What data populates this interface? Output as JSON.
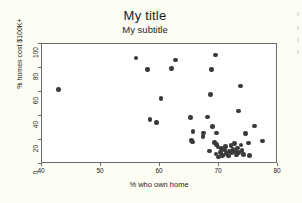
{
  "chart_data": {
    "type": "scatter",
    "title": "My title",
    "subtitle": "My subtitle",
    "xlabel": "% who own home",
    "ylabel": "% homes cost $100K+",
    "xlim": [
      40,
      80
    ],
    "ylim": [
      0,
      100
    ],
    "xticks": [
      40,
      50,
      60,
      70,
      80
    ],
    "yticks": [
      0,
      20,
      40,
      60,
      80,
      100
    ],
    "grid": false,
    "legend": null,
    "marker": {
      "shape": "circle",
      "color": "#3a3a3a",
      "size": 4.6
    },
    "points": [
      {
        "x": 42.8,
        "y": 62.0
      },
      {
        "x": 55.9,
        "y": 88.5
      },
      {
        "x": 57.9,
        "y": 78.6
      },
      {
        "x": 58.3,
        "y": 37.3
      },
      {
        "x": 59.4,
        "y": 34.8
      },
      {
        "x": 60.2,
        "y": 54.4
      },
      {
        "x": 61.9,
        "y": 79.4
      },
      {
        "x": 62.6,
        "y": 86.6
      },
      {
        "x": 65.2,
        "y": 38.8
      },
      {
        "x": 65.6,
        "y": 27.3
      },
      {
        "x": 65.3,
        "y": 19.8
      },
      {
        "x": 65.5,
        "y": 18.2
      },
      {
        "x": 67.3,
        "y": 23.1
      },
      {
        "x": 67.4,
        "y": 25.9
      },
      {
        "x": 68.1,
        "y": 39.3
      },
      {
        "x": 68.6,
        "y": 58.0
      },
      {
        "x": 68.7,
        "y": 78.8
      },
      {
        "x": 69.4,
        "y": 90.9
      },
      {
        "x": 68.9,
        "y": 31.1
      },
      {
        "x": 69.6,
        "y": 25.9
      },
      {
        "x": 68.4,
        "y": 11.0
      },
      {
        "x": 69.2,
        "y": 18.0
      },
      {
        "x": 69.6,
        "y": 16.4
      },
      {
        "x": 69.8,
        "y": 14.0
      },
      {
        "x": 69.5,
        "y": 8.3
      },
      {
        "x": 69.9,
        "y": 5.7
      },
      {
        "x": 70.3,
        "y": 9.4
      },
      {
        "x": 70.4,
        "y": 12.8
      },
      {
        "x": 70.6,
        "y": 7.1
      },
      {
        "x": 70.9,
        "y": 11.6
      },
      {
        "x": 71.1,
        "y": 14.6
      },
      {
        "x": 71.3,
        "y": 8.8
      },
      {
        "x": 71.6,
        "y": 6.5
      },
      {
        "x": 71.8,
        "y": 11.0
      },
      {
        "x": 72.0,
        "y": 15.2
      },
      {
        "x": 72.1,
        "y": 9.0
      },
      {
        "x": 72.4,
        "y": 12.2
      },
      {
        "x": 72.6,
        "y": 17.0
      },
      {
        "x": 72.8,
        "y": 10.2
      },
      {
        "x": 73.0,
        "y": 7.5
      },
      {
        "x": 73.1,
        "y": 13.4
      },
      {
        "x": 73.3,
        "y": 44.3
      },
      {
        "x": 73.4,
        "y": 9.8
      },
      {
        "x": 73.6,
        "y": 65.0
      },
      {
        "x": 73.7,
        "y": 16.0
      },
      {
        "x": 73.9,
        "y": 11.4
      },
      {
        "x": 74.2,
        "y": 7.9
      },
      {
        "x": 74.5,
        "y": 25.4
      },
      {
        "x": 75.0,
        "y": 17.6
      },
      {
        "x": 75.2,
        "y": 7.2
      },
      {
        "x": 76.0,
        "y": 31.8
      },
      {
        "x": 77.4,
        "y": 19.0
      }
    ],
    "edge_marks": [
      8,
      22,
      34,
      46
    ]
  }
}
